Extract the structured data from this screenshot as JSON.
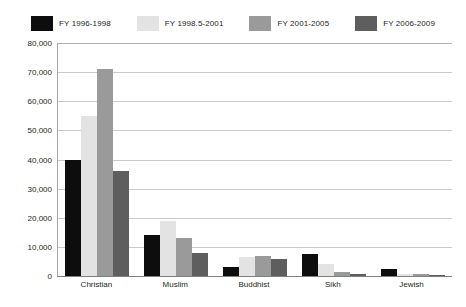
{
  "chart_data": {
    "type": "bar",
    "title": "",
    "xlabel": "",
    "ylabel": "",
    "ylim": [
      0,
      80000
    ],
    "yticks": [
      0,
      10000,
      20000,
      30000,
      40000,
      50000,
      60000,
      70000,
      80000
    ],
    "ytick_labels": [
      "0",
      "10,000",
      "20,000",
      "30,000",
      "40,000",
      "50,000",
      "60,000",
      "70,000",
      "80,000"
    ],
    "grid": true,
    "legend_position": "top",
    "categories": [
      "Christian",
      "Muslim",
      "Buddhist",
      "Sikh",
      "Jewish"
    ],
    "series": [
      {
        "name": "FY 1996-1998",
        "color": "#0d0d0d",
        "values": [
          40000,
          14000,
          3000,
          7500,
          2500
        ]
      },
      {
        "name": "FY 1998.5-2001",
        "color": "#e3e3e3",
        "values": [
          55000,
          19000,
          6500,
          4200,
          800
        ]
      },
      {
        "name": "FY 2001-2005",
        "color": "#9a9a9a",
        "values": [
          71000,
          13000,
          7000,
          1500,
          600
        ]
      },
      {
        "name": "FY 2006-2009",
        "color": "#5e5e5e",
        "values": [
          36000,
          8000,
          6000,
          700,
          500
        ]
      }
    ]
  },
  "legend": {
    "entries": [
      {
        "label": "FY 1996-1998",
        "color": "#0d0d0d"
      },
      {
        "label": "FY 1998.5-2001",
        "color": "#e3e3e3"
      },
      {
        "label": "FY 2001-2005",
        "color": "#9a9a9a"
      },
      {
        "label": "FY 2006-2009",
        "color": "#5e5e5e"
      }
    ]
  }
}
